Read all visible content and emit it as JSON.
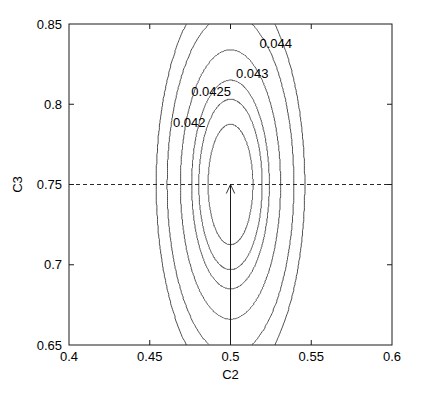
{
  "chart_data": {
    "type": "line",
    "title": "",
    "xlabel": "C2",
    "ylabel": "C3",
    "xlim": [
      0.4,
      0.6
    ],
    "ylim": [
      0.65,
      0.85
    ],
    "grid": false,
    "legend": false,
    "plot_kind": "contour",
    "x_ticks": [
      0.4,
      0.45,
      0.5,
      0.55,
      0.6
    ],
    "x_tick_labels": [
      "0.4",
      "0.45",
      "0.5",
      "0.55",
      "0.6"
    ],
    "y_ticks": [
      0.65,
      0.7,
      0.75,
      0.8,
      0.85
    ],
    "y_tick_labels": [
      "0.65",
      "0.7",
      "0.75",
      "0.8",
      "0.85"
    ],
    "center": [
      0.5,
      0.75
    ],
    "minimum_value": 0.0415,
    "labeled_levels": [
      0.042,
      0.0425,
      0.043,
      0.044
    ],
    "all_levels": [
      0.042,
      0.0425,
      0.043,
      0.044,
      0.0455,
      0.047
    ],
    "contour_labels": [
      {
        "text": "0.042",
        "level": 0.042,
        "x": 0.4745,
        "y": 0.7885
      },
      {
        "text": "0.0425",
        "level": 0.0425,
        "x": 0.488,
        "y": 0.8075
      },
      {
        "text": "0.043",
        "level": 0.043,
        "x": 0.5135,
        "y": 0.819
      },
      {
        "text": "0.044",
        "level": 0.044,
        "x": 0.528,
        "y": 0.8375
      }
    ],
    "annotations": [
      {
        "kind": "dashed-horizontal-line",
        "y": 0.75,
        "x_start": 0.4,
        "x_end": 0.6
      },
      {
        "kind": "vertical-arrow",
        "x": 0.5,
        "y_start": 0.65,
        "y_end": 0.75,
        "points_to": "optimum"
      }
    ]
  },
  "colors": {
    "background": "#ffffff",
    "contour": "#3a3a3a",
    "frame": "#1a1a1a",
    "text": "#000000",
    "guide": "#2a2a2a"
  }
}
